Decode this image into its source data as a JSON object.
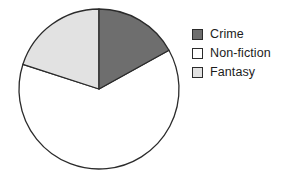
{
  "chart_data": {
    "type": "pie",
    "title": "",
    "categories": [
      "Crime",
      "Non-fiction",
      "Fantasy"
    ],
    "values": [
      17,
      72,
      11
    ],
    "units": "percent",
    "start_angle_deg": 0,
    "direction": "clockwise",
    "colors": [
      "#6e6e6e",
      "#ffffff",
      "#e2e2e2"
    ],
    "outline_color": "#2b2b2b",
    "legend_position": "right",
    "grid": false,
    "slices": [
      {
        "label": "Crime",
        "value": 17,
        "color": "#6e6e6e",
        "start_deg": 0,
        "end_deg": 61
      },
      {
        "label": "Non-fiction",
        "value": 72,
        "color": "#ffffff",
        "start_deg": 61,
        "end_deg": 288
      },
      {
        "label": "Fantasy",
        "value": 11,
        "color": "#e2e2e2",
        "start_deg": 288,
        "end_deg": 360
      }
    ]
  },
  "legend": {
    "items": [
      {
        "label": "Crime",
        "swatch_color": "#6e6e6e",
        "swatch_name": "legend-swatch-crime"
      },
      {
        "label": "Non-fiction",
        "swatch_color": "#ffffff",
        "swatch_name": "legend-swatch-non-fiction"
      },
      {
        "label": "Fantasy",
        "swatch_color": "#e2e2e2",
        "swatch_name": "legend-swatch-fantasy"
      }
    ]
  }
}
